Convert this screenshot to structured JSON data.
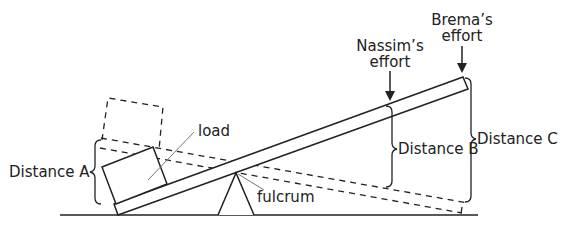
{
  "labels": {
    "load": "load",
    "fulcrum": "fulcrum",
    "distance_a": "Distance A",
    "distance_b": "Distance B",
    "distance_c": "Distance C",
    "nassim_line1": "Nassim’s",
    "nassim_line2": "effort",
    "brema_line1": "Brema’s",
    "brema_line2": "effort"
  },
  "colors": {
    "stroke": "#222222",
    "leader": "#777777"
  }
}
